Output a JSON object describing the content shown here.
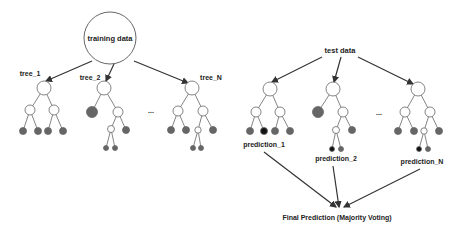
{
  "diagram": {
    "type": "random-forest",
    "colors": {
      "edge": "#555555",
      "arrow": "#333333",
      "leaf_gray": "#666666",
      "leaf_black": "#111111",
      "node_fill": "#ffffff"
    },
    "left": {
      "root_label": "training data",
      "trees": [
        {
          "label": "tree_1"
        },
        {
          "label": "tree_2"
        },
        {
          "label": "tree_N"
        }
      ],
      "ellipsis": "..."
    },
    "right": {
      "root_label": "test data",
      "predictions": [
        {
          "label": "prediction_1"
        },
        {
          "label": "prediction_2"
        },
        {
          "label": "prediction_N"
        }
      ],
      "ellipsis": "...",
      "final_label": "Final Prediction (Majority Voting)"
    }
  }
}
